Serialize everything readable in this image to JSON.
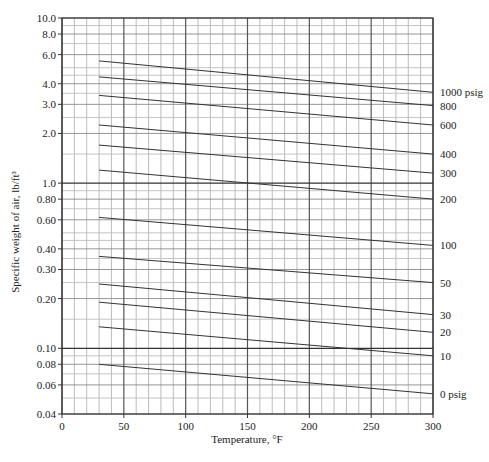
{
  "chart_data": {
    "type": "line",
    "title": "",
    "xlabel": "Temperature, °F",
    "ylabel": "Specific weight of air, lb/ft³",
    "xscale": "linear",
    "yscale": "log",
    "xlim": [
      0,
      300
    ],
    "ylim": [
      0.04,
      10.0
    ],
    "grid": true,
    "legend": "none (curves labeled at right end)",
    "x_ticks": [
      0,
      50,
      100,
      150,
      200,
      250,
      300
    ],
    "x_tick_labels": [
      "0",
      "50",
      "100",
      "150",
      "200",
      "250",
      "300"
    ],
    "y_ticks": [
      0.04,
      0.06,
      0.08,
      0.1,
      0.2,
      0.3,
      0.4,
      0.6,
      0.8,
      1.0,
      2.0,
      3.0,
      4.0,
      6.0,
      8.0,
      10.0
    ],
    "y_tick_labels": [
      "0.04",
      "0.06",
      "0.08",
      "0.10",
      "0.20",
      "0.30",
      "0.40",
      "0.60",
      "0.80",
      "1.0",
      "2.0",
      "3.0",
      "4.0",
      "6.0",
      "8.0",
      "10.0"
    ],
    "x_minor_step": 10,
    "y_gridlines": [
      0.04,
      0.05,
      0.06,
      0.07,
      0.08,
      0.09,
      0.1,
      0.15,
      0.2,
      0.25,
      0.3,
      0.35,
      0.4,
      0.45,
      0.5,
      0.6,
      0.7,
      0.8,
      0.9,
      1.0,
      1.5,
      2.0,
      2.5,
      3.0,
      3.5,
      4.0,
      4.5,
      5.0,
      6.0,
      7.0,
      8.0,
      9.0,
      10.0
    ],
    "y_major_gridlines": [
      0.1,
      1.0
    ],
    "series": [
      {
        "name": "1000 psig",
        "label": "1000 psig",
        "x": [
          30,
          300
        ],
        "values": [
          5.5,
          3.55
        ]
      },
      {
        "name": "800 psig",
        "label": "800",
        "x": [
          30,
          300
        ],
        "values": [
          4.4,
          2.95
        ]
      },
      {
        "name": "600 psig",
        "label": "600",
        "x": [
          30,
          300
        ],
        "values": [
          3.4,
          2.25
        ]
      },
      {
        "name": "400 psig",
        "label": "400",
        "x": [
          30,
          300
        ],
        "values": [
          2.25,
          1.5
        ]
      },
      {
        "name": "300 psig",
        "label": "300",
        "x": [
          30,
          300
        ],
        "values": [
          1.7,
          1.15
        ]
      },
      {
        "name": "200 psig",
        "label": "200",
        "x": [
          30,
          300
        ],
        "values": [
          1.2,
          0.8
        ]
      },
      {
        "name": "100 psig",
        "label": "100",
        "x": [
          30,
          300
        ],
        "values": [
          0.62,
          0.42
        ]
      },
      {
        "name": "50 psig",
        "label": "50",
        "x": [
          30,
          300
        ],
        "values": [
          0.36,
          0.25
        ]
      },
      {
        "name": "30 psig",
        "label": "30",
        "x": [
          30,
          300
        ],
        "values": [
          0.245,
          0.16
        ]
      },
      {
        "name": "20 psig",
        "label": "20",
        "x": [
          30,
          300
        ],
        "values": [
          0.19,
          0.125
        ]
      },
      {
        "name": "10 psig",
        "label": "10",
        "x": [
          30,
          300
        ],
        "values": [
          0.135,
          0.09
        ]
      },
      {
        "name": "0 psig",
        "label": "0 psig",
        "x": [
          30,
          300
        ],
        "values": [
          0.08,
          0.053
        ]
      }
    ]
  }
}
